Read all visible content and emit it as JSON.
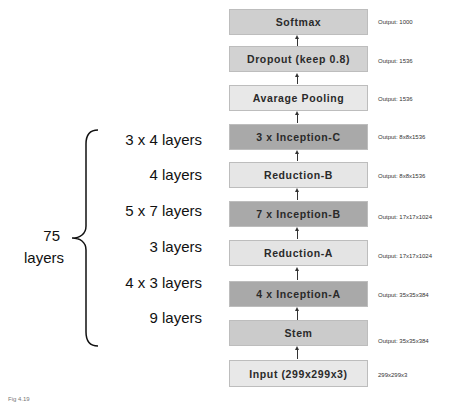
{
  "diagram": {
    "colors": {
      "dark_box": "#a9a9a9",
      "mid_box": "#cfcfcf",
      "light_box": "#e6e6e6",
      "border": "#bdbdbd"
    },
    "blocks": [
      {
        "label": "Softmax",
        "output": "Output: 1000",
        "shade": "mid"
      },
      {
        "label": "Dropout (keep 0.8)",
        "output": "Output: 1536",
        "shade": "mid"
      },
      {
        "label": "Avarage Pooling",
        "output": "Output: 1536",
        "shade": "light"
      },
      {
        "label": "3 x Inception-C",
        "output": "Output: 8x8x1536",
        "shade": "dark"
      },
      {
        "label": "Reduction-B",
        "output": "Output: 8x8x1536",
        "shade": "light"
      },
      {
        "label": "7 x Inception-B",
        "output": "Output: 17x17x1024",
        "shade": "dark"
      },
      {
        "label": "Reduction-A",
        "output": "Output: 17x17x1024",
        "shade": "light"
      },
      {
        "label": "4 x Inception-A",
        "output": "Output: 35x35x384",
        "shade": "dark"
      },
      {
        "label": "Stem",
        "output": "Output: 35x35x384",
        "shade": "mid"
      },
      {
        "label": "Input (299x299x3)",
        "output": "299x299x3",
        "shade": "light"
      }
    ],
    "layer_counts": [
      "3 x 4 layers",
      "4 layers",
      "5 x 7 layers",
      "3 layers",
      "4 x 3 layers",
      "9 layers"
    ],
    "total": {
      "number": "75",
      "unit": "layers"
    },
    "caption": "Fig 4.19"
  }
}
